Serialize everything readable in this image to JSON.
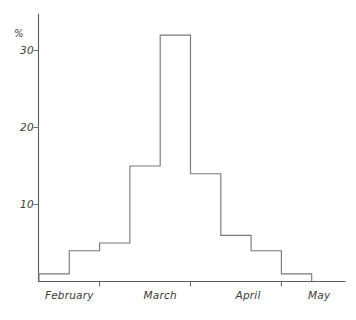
{
  "chart_data": {
    "type": "bar",
    "title": "",
    "subtitle": "",
    "xlabel": "",
    "ylabel": "%",
    "ylim": [
      0,
      34
    ],
    "xlim": [
      0,
      10
    ],
    "grid": false,
    "legend": null,
    "style": "hand-drawn histogram outline",
    "y_ticks": [
      10,
      20,
      30
    ],
    "y_tick_labels": [
      "10",
      "20",
      "30"
    ],
    "x_tick_labels": [
      "February",
      "March",
      "April",
      "May"
    ],
    "x_tick_positions": [
      1.0,
      4.0,
      7.0,
      9.3
    ],
    "categories": [
      "bin1",
      "bin2",
      "bin3",
      "bin4",
      "bin5",
      "bin6",
      "bin7",
      "bin8",
      "bin9"
    ],
    "values": [
      1,
      4,
      5,
      15,
      32,
      14,
      6,
      4,
      1
    ],
    "bin_count": 9,
    "bin_edges": [
      0,
      1,
      2,
      3,
      4,
      5,
      6,
      7,
      8,
      9
    ],
    "axis_color": "#5a5a5a",
    "line_color": "#7a7a7a",
    "text_color": "#3a3a3a",
    "background": "#ffffff"
  },
  "axes": {
    "y_unit_label": "%",
    "y_tick_labels": [
      "30",
      "20",
      "10"
    ],
    "x_tick_labels": [
      "February",
      "March",
      "April",
      "May"
    ]
  }
}
